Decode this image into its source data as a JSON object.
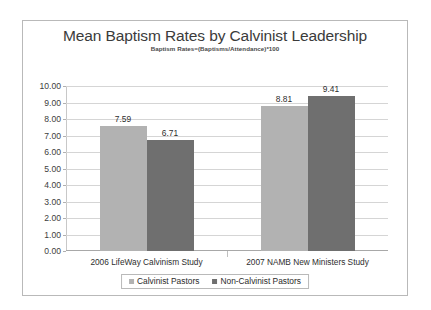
{
  "chart_data": {
    "type": "bar",
    "title": "Mean Baptism Rates by Calvinist Leadership",
    "subtitle": "Baptism Rates=(Baptisms/Attendance)*100",
    "xlabel": "",
    "ylabel": "",
    "ylim": [
      0,
      10
    ],
    "ytick_step": 1,
    "ytick_labels": [
      "0.00",
      "1.00",
      "2.00",
      "3.00",
      "4.00",
      "5.00",
      "6.00",
      "7.00",
      "8.00",
      "9.00",
      "10.00"
    ],
    "grid": true,
    "legend_position": "bottom-center",
    "categories": [
      "2006 LifeWay Calvinism Study",
      "2007 NAMB New Ministers Study"
    ],
    "series": [
      {
        "name": "Calvinist Pastors",
        "color": "#b2b2b2",
        "values": [
          7.59,
          6.71
        ],
        "value_labels": [
          "7.59",
          "8.81"
        ]
      },
      {
        "name": "Non-Calvinist Pastors",
        "color": "#6f6f6f",
        "values": [
          6.71,
          9.41
        ],
        "value_labels": [
          "6.71",
          "9.41"
        ]
      }
    ],
    "bars": [
      {
        "group": 0,
        "series": "Calvinist Pastors",
        "value": 7.59,
        "label": "7.59",
        "color": "#b2b2b2"
      },
      {
        "group": 0,
        "series": "Non-Calvinist Pastors",
        "value": 6.71,
        "label": "6.71",
        "color": "#6f6f6f"
      },
      {
        "group": 1,
        "series": "Calvinist Pastors",
        "value": 8.81,
        "label": "8.81",
        "color": "#b2b2b2"
      },
      {
        "group": 1,
        "series": "Non-Calvinist Pastors",
        "value": 9.41,
        "label": "9.41",
        "color": "#6f6f6f"
      }
    ]
  },
  "legend": {
    "items": [
      {
        "label": "Calvinist Pastors",
        "color": "#b2b2b2"
      },
      {
        "label": "Non-Calvinist Pastors",
        "color": "#6f6f6f"
      }
    ]
  }
}
